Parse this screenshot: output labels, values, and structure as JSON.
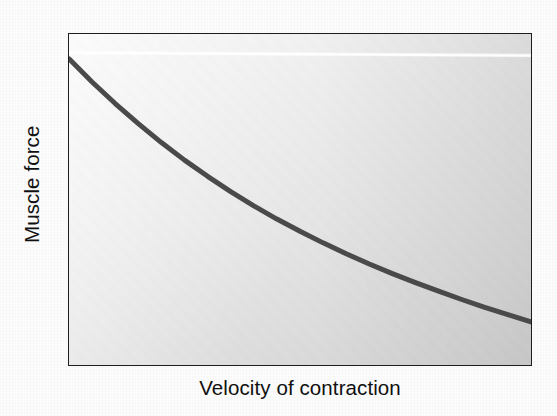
{
  "figure": {
    "kind": "line-graph",
    "background_color": "#fcfcfc",
    "plot_background_color": "#e6e6e6",
    "frame_color": "#1d1d1d",
    "curve_color": "#4a4a4a",
    "label_color": "#101010"
  },
  "chart_data": {
    "type": "line",
    "title": "",
    "subtitle": "",
    "xlabel": "Velocity of contraction",
    "ylabel": "Muscle force",
    "legend": [],
    "legend_position": "none",
    "grid": false,
    "axis_ticks": [],
    "xlim": [
      0,
      1
    ],
    "ylim": [
      0,
      1
    ],
    "annotations": [],
    "series": [
      {
        "name": "Force-velocity relationship",
        "description": "Hyperbolic decline of muscle force as velocity of contraction increases",
        "x": [
          0.0,
          0.05,
          0.1,
          0.15,
          0.2,
          0.25,
          0.3,
          0.35,
          0.4,
          0.45,
          0.5,
          0.55,
          0.6,
          0.65,
          0.7,
          0.75,
          0.8,
          0.85,
          0.9,
          0.95,
          1.0
        ],
        "y": [
          0.925,
          0.855,
          0.79,
          0.729,
          0.672,
          0.619,
          0.57,
          0.524,
          0.481,
          0.441,
          0.404,
          0.369,
          0.336,
          0.305,
          0.276,
          0.249,
          0.223,
          0.198,
          0.174,
          0.152,
          0.13
        ]
      }
    ]
  }
}
